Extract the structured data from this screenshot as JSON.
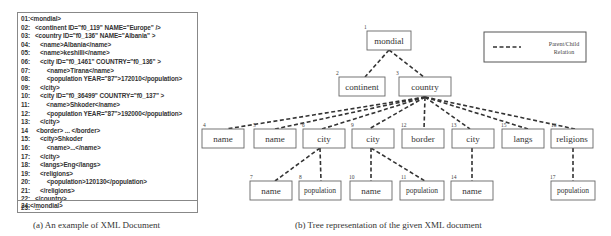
{
  "xml_document": {
    "lines": [
      "01:<mondial>",
      "02:   <continent ID=\"f0_119\" NAME=\"Europe\" />",
      "03:   <country ID=\"f0_136\" NAME=\"Albania\" >",
      "04:      <name>Albania</name>",
      "05:      <name>keshilli</name>",
      "06:      <city ID=\"f0_1461\" COUNTRY=\"f0_136\" >",
      "07:          <name>Tirana</name>",
      "08:          <population YEAR=\"87\">172010</population>",
      "09:      </city>",
      "10:      <city ID=\"f0_36499\" COUNTRY=\"f0_137\" >",
      "11:          <name>Shkoder</name>",
      "12:          <population YEAR=\"87\">192000</population>",
      "13:      </city>",
      "14     <border> ... </border>",
      "15:      <city>Shkoder",
      "16:          <name>...</name>",
      "17:      </city>",
      "18:      <langs>Eng</langs>",
      "19:      <religions>",
      "20:          <population>120130</population>",
      "21:      </religions>",
      "22:   </country>",
      "23:   ..."
    ],
    "last_line": "24:</mondial>",
    "caption": "(a) An example of XML Document"
  },
  "tree": {
    "caption": "(b) Tree representation of the given XML document",
    "legend": {
      "line1": "Parent/Child",
      "line2": "Relation"
    },
    "nodes": [
      {
        "id": 1,
        "label": "mondial"
      },
      {
        "id": 2,
        "label": "continent"
      },
      {
        "id": 3,
        "label": "country"
      },
      {
        "id": 4,
        "label": "name"
      },
      {
        "id": 5,
        "label": "name"
      },
      {
        "id": 6,
        "label": "city"
      },
      {
        "id": 7,
        "label": "name"
      },
      {
        "id": 8,
        "label": "population"
      },
      {
        "id": 9,
        "label": "city"
      },
      {
        "id": 10,
        "label": "name"
      },
      {
        "id": 11,
        "label": "population"
      },
      {
        "id": 12,
        "label": "border"
      },
      {
        "id": 13,
        "label": "city"
      },
      {
        "id": 14,
        "label": "name"
      },
      {
        "id": 15,
        "label": "langs"
      },
      {
        "id": 16,
        "label": "religions"
      },
      {
        "id": 17,
        "label": "population"
      }
    ],
    "node_numbers": {
      "n1": "1",
      "n2": "2",
      "n3": "3",
      "n4": "4",
      "n5": "5",
      "n6": "6",
      "n7": "7",
      "n8": "8",
      "n9": "9",
      "n10": "10",
      "n11": "11",
      "n12": "12",
      "n13": "13",
      "n14": "14",
      "n15": "15",
      "n16": "16",
      "n17": "17"
    },
    "edges": [
      [
        1,
        2
      ],
      [
        1,
        3
      ],
      [
        3,
        4
      ],
      [
        3,
        5
      ],
      [
        3,
        6
      ],
      [
        3,
        9
      ],
      [
        3,
        12
      ],
      [
        3,
        13
      ],
      [
        3,
        15
      ],
      [
        3,
        16
      ],
      [
        6,
        7
      ],
      [
        6,
        8
      ],
      [
        9,
        10
      ],
      [
        9,
        11
      ],
      [
        13,
        14
      ],
      [
        16,
        17
      ]
    ]
  }
}
